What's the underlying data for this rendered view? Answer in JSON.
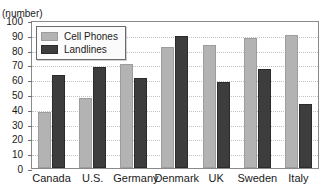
{
  "axis_unit_label": "(number)",
  "colors": {
    "cell_phones": "#b3b3b3",
    "landlines": "#3d3d3d",
    "gridline": "#c2c2c2",
    "axis": "#8a8a8a",
    "text": "#1a1a1a"
  },
  "legend": {
    "position": "top-left-inside",
    "entries": [
      {
        "label": "Cell Phones",
        "color": "#b3b3b3"
      },
      {
        "label": "Landlines",
        "color": "#3d3d3d"
      }
    ]
  },
  "chart_data": {
    "type": "bar",
    "title": "",
    "xlabel": "",
    "ylabel": "(number)",
    "ylim": [
      0,
      100
    ],
    "ytick_step": 10,
    "yticks": [
      100,
      90,
      80,
      70,
      60,
      50,
      40,
      30,
      20,
      10,
      0
    ],
    "ytick_labels": [
      "100",
      "90",
      "80",
      "70",
      "60",
      "50",
      "40",
      "30",
      "20",
      "10",
      "0"
    ],
    "grid": true,
    "legend_position": "upper left",
    "categories": [
      "Canada",
      "U.S.",
      "Germany",
      "Denmark",
      "UK",
      "Sweden",
      "Italy"
    ],
    "series": [
      {
        "name": "Cell Phones",
        "color": "#b3b3b3",
        "values": [
          38,
          47,
          70,
          82,
          83,
          88,
          90
        ]
      },
      {
        "name": "Landlines",
        "color": "#3d3d3d",
        "values": [
          63,
          68,
          61,
          89,
          58,
          67,
          43
        ]
      }
    ]
  }
}
